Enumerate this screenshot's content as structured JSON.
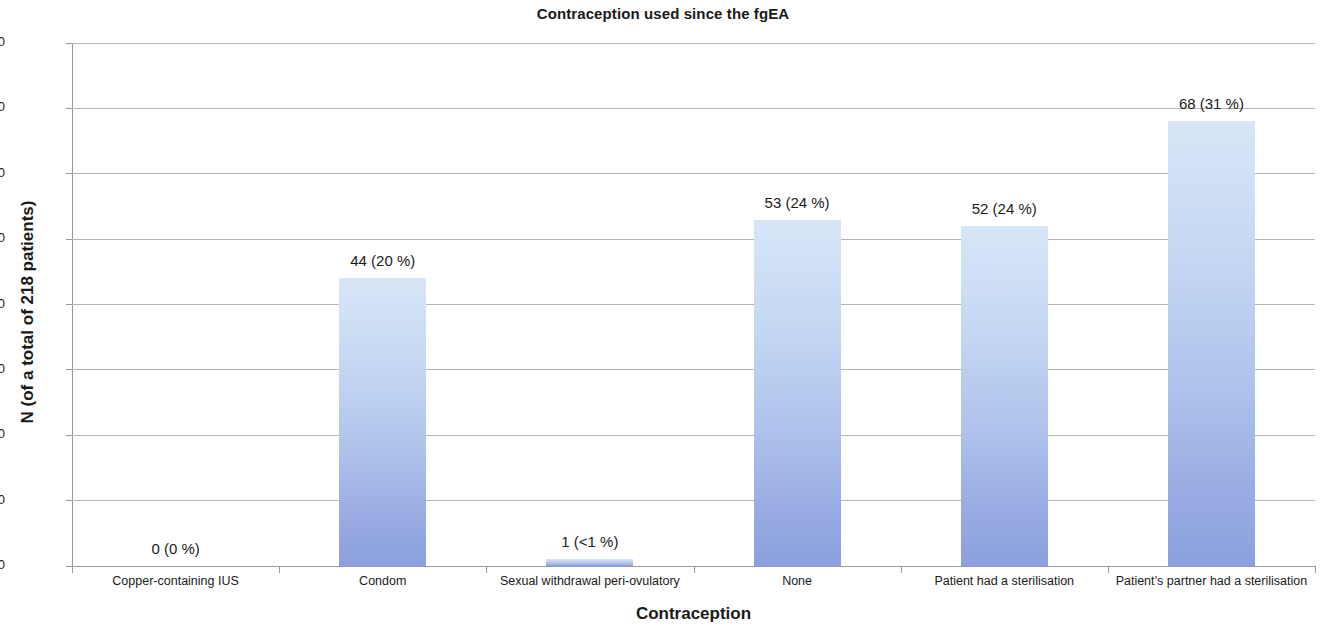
{
  "chart_data": {
    "type": "bar",
    "title": "Contraception used since the fgEA",
    "xlabel": "Contraception",
    "ylabel": "N (of a total of 218 patients)",
    "ylim": [
      0,
      80
    ],
    "yticks": [
      0,
      10,
      20,
      30,
      40,
      50,
      60,
      70,
      80
    ],
    "ytick_labels": [
      "0",
      "10",
      "20",
      "30",
      "40",
      "50",
      "60",
      "70",
      "80"
    ],
    "grid": true,
    "legend": "none",
    "total_patients": 218,
    "bar_color_top": "#d8e5f7",
    "bar_color_bottom": "#8ba0dd",
    "gridline_color": "#b5b5b5",
    "categories": [
      "Copper-containing IUS",
      "Condom",
      "Sexual withdrawal peri-ovulatory",
      "None",
      "Patient had a sterilisation",
      "Patient’s partner had a sterilisation"
    ],
    "values": [
      0,
      44,
      1,
      53,
      52,
      68
    ],
    "percents": [
      "0 %",
      "20 %",
      "<1 %",
      "24 %",
      "24 %",
      "31 %"
    ],
    "data_labels": [
      "0 (0 %)",
      "44 (20 %)",
      "1 (<1 %)",
      "53 (24 %)",
      "52 (24 %)",
      "68 (31 %)"
    ]
  }
}
